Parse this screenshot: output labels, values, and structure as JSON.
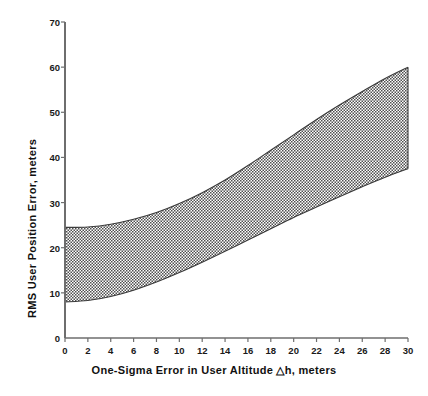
{
  "chart_data": {
    "type": "area",
    "title": "",
    "subtitle": "",
    "xlabel": "One-Sigma Error in User Altitude  △h, meters",
    "ylabel": "RMS User Position Error, meters",
    "xlim": [
      0,
      30
    ],
    "ylim": [
      0,
      70
    ],
    "xticks": [
      0,
      2,
      4,
      6,
      8,
      10,
      12,
      14,
      16,
      18,
      20,
      22,
      24,
      26,
      28,
      30
    ],
    "yticks": [
      0,
      10,
      20,
      30,
      40,
      50,
      60,
      70
    ],
    "xtick_labels": [
      "0",
      "2",
      "4",
      "6",
      "8",
      "10",
      "12",
      "14",
      "16",
      "18",
      "20",
      "22",
      "24",
      "26",
      "28",
      "30"
    ],
    "ytick_labels": [
      "0",
      "10",
      "20",
      "30",
      "40",
      "50",
      "60",
      "70"
    ],
    "grid": false,
    "legend": null,
    "annotations": [],
    "fill_style": "crosshatch",
    "fill_color": "#6b6b6b",
    "band_label": "RMS user position error band",
    "x": [
      0,
      2,
      4,
      6,
      8,
      10,
      12,
      14,
      16,
      18,
      20,
      22,
      24,
      26,
      28,
      30
    ],
    "series": [
      {
        "name": "Upper bound",
        "values": [
          24.5,
          24.6,
          25.2,
          26.3,
          27.8,
          29.8,
          32.2,
          35.0,
          38.2,
          41.6,
          45.0,
          48.4,
          51.6,
          54.6,
          57.5,
          60.0
        ]
      },
      {
        "name": "Lower bound",
        "values": [
          8.0,
          8.3,
          9.2,
          10.6,
          12.4,
          14.5,
          16.8,
          19.2,
          21.7,
          24.2,
          26.7,
          29.0,
          31.3,
          33.5,
          35.6,
          37.5
        ]
      }
    ]
  },
  "axes": {
    "y_title": "RMS User Position Error, meters",
    "x_title": "One-Sigma Error in User Altitude  △h, meters"
  },
  "icons": {
    "delta": "△"
  }
}
